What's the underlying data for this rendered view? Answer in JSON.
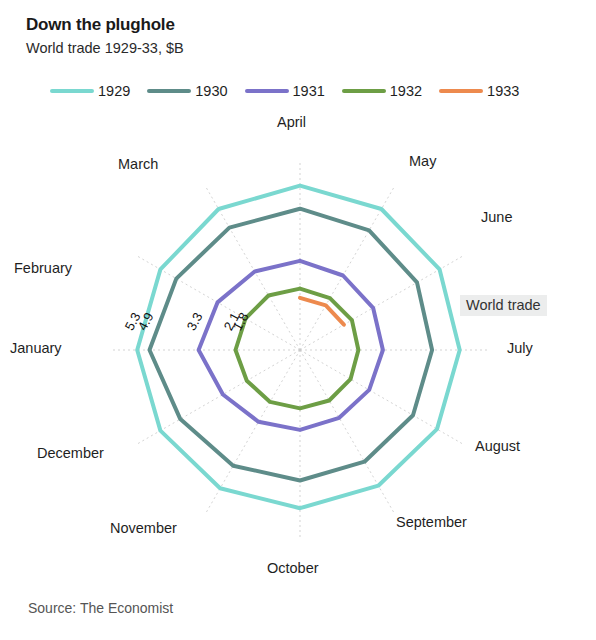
{
  "header": {
    "title": "Down the plughole",
    "subtitle": "World trade 1929-33, $B"
  },
  "legend": {
    "items": [
      {
        "label": "1929",
        "color": "#7ad8d0"
      },
      {
        "label": "1930",
        "color": "#5e8c89"
      },
      {
        "label": "1931",
        "color": "#7b72c9"
      },
      {
        "label": "1932",
        "color": "#6d9e45"
      },
      {
        "label": "1933",
        "color": "#ed8a4e"
      }
    ]
  },
  "annotation": {
    "world_trade": "World trade"
  },
  "source": {
    "text": "Source: The Economist"
  },
  "chart_data": {
    "type": "line",
    "title": "Down the plughole",
    "subtitle": "World trade 1929-33, $B",
    "xlabel": "",
    "ylabel": "",
    "projection": "polar-spiral",
    "grid": true,
    "legend_position": "top",
    "units": "$B",
    "annotations": [
      {
        "text": "World trade",
        "position": "right"
      }
    ],
    "categories": [
      "January",
      "February",
      "March",
      "April",
      "May",
      "June",
      "July",
      "August",
      "September",
      "October",
      "November",
      "December"
    ],
    "angle_start_category": "April",
    "angle_direction": "clockwise",
    "radial_ticks": [
      {
        "label": "5.3",
        "value": 5.3,
        "series": "1929"
      },
      {
        "label": "4.9",
        "value": 4.9,
        "series": "1930"
      },
      {
        "label": "3.3",
        "value": 3.3,
        "series": "1931"
      },
      {
        "label": "2.1",
        "value": 2.1,
        "series": "1932"
      },
      {
        "label": "1.8",
        "value": 1.8,
        "series": "1933"
      }
    ],
    "rlim": [
      0,
      5.6
    ],
    "series": [
      {
        "name": "1929",
        "color": "#7ad8d0",
        "values": [
          5.3,
          5.25,
          5.3,
          5.35,
          5.3,
          5.25,
          5.2,
          5.15,
          5.1,
          5.15,
          5.2,
          5.25
        ]
      },
      {
        "name": "1930",
        "color": "#5e8c89",
        "values": [
          4.9,
          4.65,
          4.6,
          4.6,
          4.5,
          4.4,
          4.3,
          4.25,
          4.2,
          4.25,
          4.35,
          4.5
        ]
      },
      {
        "name": "1931",
        "color": "#7b72c9",
        "values": [
          3.3,
          3.1,
          2.95,
          2.9,
          2.8,
          2.75,
          2.7,
          2.6,
          2.55,
          2.6,
          2.7,
          2.9
        ]
      },
      {
        "name": "1932",
        "color": "#6d9e45",
        "values": [
          2.1,
          2.05,
          2.05,
          2.0,
          1.95,
          1.95,
          1.9,
          1.9,
          1.9,
          1.9,
          1.95,
          2.0
        ]
      },
      {
        "name": "1933",
        "color": "#ed8a4e",
        "values": [
          1.8,
          1.75,
          1.72,
          1.7,
          1.68,
          1.65,
          null,
          null,
          null,
          null,
          null,
          null
        ]
      }
    ]
  },
  "axes": {
    "months": [
      {
        "label": "April",
        "x": 277,
        "y": 6
      },
      {
        "label": "May",
        "x": 409,
        "y": 45
      },
      {
        "label": "June",
        "x": 481,
        "y": 101
      },
      {
        "label": "July",
        "x": 507,
        "y": 232
      },
      {
        "label": "August",
        "x": 475,
        "y": 330
      },
      {
        "label": "September",
        "x": 396,
        "y": 406
      },
      {
        "label": "October",
        "x": 267,
        "y": 452
      },
      {
        "label": "November",
        "x": 110,
        "y": 412
      },
      {
        "label": "December",
        "x": 37,
        "y": 337
      },
      {
        "label": "January",
        "x": 10,
        "y": 232
      },
      {
        "label": "February",
        "x": 14,
        "y": 152
      },
      {
        "label": "March",
        "x": 118,
        "y": 48
      }
    ]
  }
}
